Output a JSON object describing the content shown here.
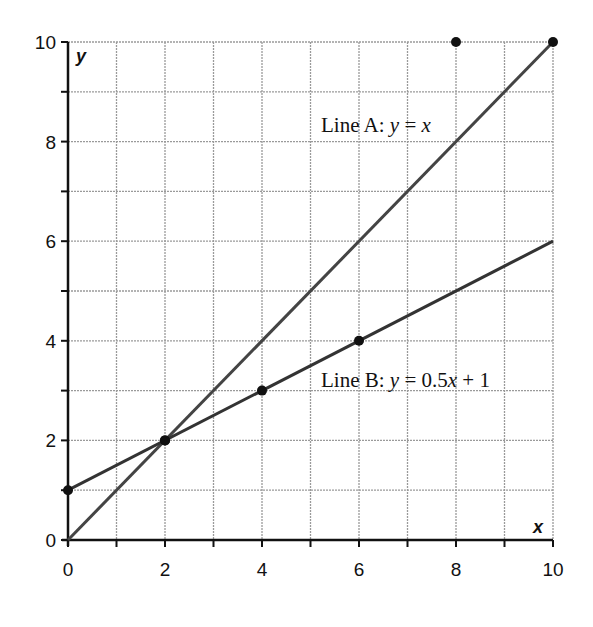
{
  "chart_data": {
    "type": "line",
    "title": "",
    "xlabel": "x",
    "ylabel": "y",
    "xlim": [
      0,
      10
    ],
    "ylim": [
      0,
      10
    ],
    "grid": true,
    "x_ticks": [
      0,
      2,
      4,
      6,
      8,
      10
    ],
    "y_ticks": [
      0,
      2,
      4,
      6,
      8,
      10
    ],
    "x_tick_labels": [
      "0",
      "2",
      "4",
      "6",
      "8",
      "10"
    ],
    "y_tick_labels": [
      "0",
      "2",
      "4",
      "6",
      "8",
      "10"
    ],
    "series": [
      {
        "name": "Line A",
        "equation": "y = x",
        "label_prefix": "Line A: ",
        "label_y": "y",
        "label_eq": " = ",
        "label_rhs": "x",
        "label_rhs_tail": "",
        "x": [
          0,
          10
        ],
        "y": [
          0,
          10
        ],
        "color": "#444444",
        "points": [
          [
            2,
            2
          ],
          [
            10,
            10
          ]
        ]
      },
      {
        "name": "Line B",
        "equation": "y = 0.5x + 1",
        "label_prefix": "Line B: ",
        "label_y": "y",
        "label_eq": " = 0.5",
        "label_rhs": "x",
        "label_rhs_tail": " + 1",
        "x": [
          0,
          10
        ],
        "y": [
          1,
          6
        ],
        "color": "#333333",
        "points": [
          [
            0,
            1
          ],
          [
            2,
            2
          ],
          [
            4,
            3
          ],
          [
            6,
            4
          ]
        ]
      }
    ],
    "extra_points": [
      [
        8,
        10
      ]
    ],
    "annotations": [
      {
        "text": "Line A: y = x",
        "x": 5.3,
        "y": 8.3
      },
      {
        "text": "Line B: y = 0.5x + 1",
        "x": 5.3,
        "y": 3.1
      }
    ]
  }
}
